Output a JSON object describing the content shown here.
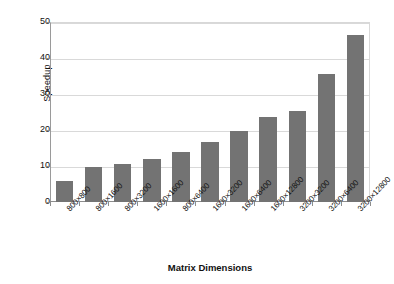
{
  "chart_data": {
    "type": "bar",
    "title": "",
    "xlabel": "Matrix Dimensions",
    "ylabel": "Speedup",
    "categories": [
      "800×800",
      "800×1600",
      "800×3200",
      "1600×1600",
      "800×6400",
      "1600×3200",
      "1600×6400",
      "1600×12800",
      "3200×3200",
      "3200×6400",
      "3200×12800"
    ],
    "values": [
      5.8,
      9.8,
      10.5,
      11.9,
      14.0,
      16.7,
      19.8,
      23.6,
      25.2,
      35.5,
      46.3
    ],
    "ylim": [
      0,
      50
    ],
    "yticks": [
      0,
      10,
      20,
      30,
      40,
      50
    ],
    "ytick_labels": [
      "0",
      "10",
      "20",
      "30",
      "40",
      "50"
    ],
    "grid": true,
    "legend": "none",
    "bar_color": "#737373",
    "grid_color": "#d9d9d9",
    "axis_color": "#8d8d8d",
    "background": "#ffffff"
  }
}
